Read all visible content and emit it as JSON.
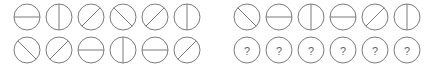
{
  "puzzle": {
    "type": "visual-analogy-matrix",
    "background_color": "#ffffff",
    "stroke_color": "#7b7b7b",
    "question_glyph": "?",
    "disc_radius": 13,
    "stroke_width": 1,
    "matrix": {
      "label": "matrix-panel",
      "rows": 2,
      "columns": 6,
      "cells": [
        [
          {
            "shape": "circle",
            "divider": "horizontal"
          },
          {
            "shape": "circle",
            "divider": "vertical"
          },
          {
            "shape": "circle",
            "divider": "diagonal-forward"
          },
          {
            "shape": "circle",
            "divider": "diagonal-back"
          },
          {
            "shape": "circle",
            "divider": "diagonal-forward"
          },
          {
            "shape": "circle",
            "divider": "vertical"
          }
        ],
        [
          {
            "shape": "circle",
            "divider": "diagonal-back"
          },
          {
            "shape": "circle",
            "divider": "diagonal-forward"
          },
          {
            "shape": "circle",
            "divider": "horizontal"
          },
          {
            "shape": "circle",
            "divider": "vertical"
          },
          {
            "shape": "circle",
            "divider": "horizontal"
          },
          {
            "shape": "circle",
            "divider": "diagonal-forward"
          }
        ]
      ]
    },
    "options": {
      "label": "options-panel",
      "rows": 2,
      "columns": 6,
      "prompt_row": [
        {
          "shape": "circle",
          "divider": "diagonal-back"
        },
        {
          "shape": "circle",
          "divider": "horizontal"
        },
        {
          "shape": "circle",
          "divider": "vertical"
        },
        {
          "shape": "circle",
          "divider": "horizontal"
        },
        {
          "shape": "circle",
          "divider": "diagonal-forward"
        },
        {
          "shape": "circle",
          "divider": "vertical"
        }
      ],
      "answer_row": [
        {
          "shape": "circle",
          "divider": "question",
          "label": "?"
        },
        {
          "shape": "circle",
          "divider": "question",
          "label": "?"
        },
        {
          "shape": "circle",
          "divider": "question",
          "label": "?"
        },
        {
          "shape": "circle",
          "divider": "question",
          "label": "?"
        },
        {
          "shape": "circle",
          "divider": "question",
          "label": "?"
        },
        {
          "shape": "circle",
          "divider": "question",
          "label": "?"
        }
      ]
    }
  }
}
